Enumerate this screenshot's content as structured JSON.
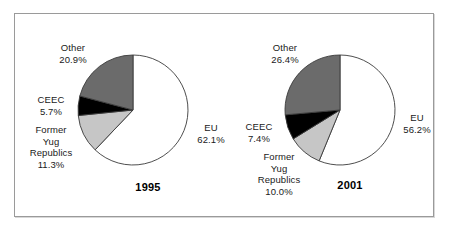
{
  "figure": {
    "background": "#ffffff",
    "frame_border_color": "#9a9a9a"
  },
  "chart_data": [
    {
      "type": "pie",
      "title": "1995",
      "categories": [
        "EU",
        "Former Yug Republics",
        "CEEC",
        "Other"
      ],
      "values": [
        62.1,
        11.3,
        5.7,
        20.9
      ],
      "value_suffix": "%",
      "colors": [
        "#ffffff",
        "#c6c6c6",
        "#000000",
        "#6b6b6b"
      ],
      "start_angle_deg": 0,
      "direction": "clockwise",
      "legend": "none",
      "labels": [
        {
          "name": "EU",
          "value": "62.1%",
          "text": "EU\n62.1%"
        },
        {
          "name": "Former Yug Republics",
          "value": "11.3%",
          "text": "Former\nYug\nRepublics\n11.3%"
        },
        {
          "name": "CEEC",
          "value": "5.7%",
          "text": "CEEC\n5.7%"
        },
        {
          "name": "Other",
          "value": "20.9%",
          "text": "Other\n20.9%"
        }
      ]
    },
    {
      "type": "pie",
      "title": "2001",
      "categories": [
        "EU",
        "Former Yug Republics",
        "CEEC",
        "Other"
      ],
      "values": [
        56.2,
        10.0,
        7.4,
        26.4
      ],
      "value_suffix": "%",
      "colors": [
        "#ffffff",
        "#c6c6c6",
        "#000000",
        "#6b6b6b"
      ],
      "start_angle_deg": 0,
      "direction": "clockwise",
      "legend": "none",
      "labels": [
        {
          "name": "EU",
          "value": "56.2%",
          "text": "EU\n56.2%"
        },
        {
          "name": "Former Yug Republics",
          "value": "10.0%",
          "text": "Former\nYug\nRepublics\n10.0%"
        },
        {
          "name": "CEEC",
          "value": "7.4%",
          "text": "CEEC\n7.4%"
        },
        {
          "name": "Other",
          "value": "26.4%",
          "text": "Other\n26.4%"
        }
      ]
    }
  ],
  "left_chart": {
    "year": "1995",
    "eu_label": "EU\n62.1%",
    "fyug_label": "Former\nYug\nRepublics\n11.3%",
    "ceec_label": "CEEC\n5.7%",
    "other_label": "Other\n20.9%"
  },
  "right_chart": {
    "year": "2001",
    "eu_label": "EU\n56.2%",
    "fyug_label": "Former\nYug\nRepublics\n10.0%",
    "ceec_label": "CEEC\n7.4%",
    "other_label": "Other\n26.4%"
  }
}
